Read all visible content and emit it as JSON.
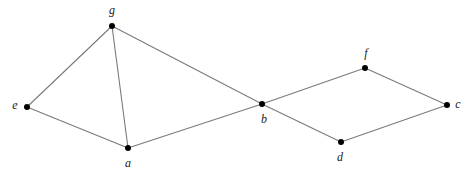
{
  "diagram": {
    "type": "undirected-graph",
    "title": "",
    "canvas": {
      "width": 470,
      "height": 178,
      "background": "#ffffff"
    },
    "style": {
      "edge_color": "#7a7a7a",
      "edge_width": 1.1,
      "node_color": "#000000",
      "node_radius": 3,
      "label_color": "#1a1a1a",
      "label_font_size": 12,
      "label_style": "italic"
    },
    "nodes": [
      {
        "id": "g",
        "label": "g",
        "x": 112,
        "y": 26,
        "label_x": 112,
        "label_y": 11
      },
      {
        "id": "e",
        "label": "e",
        "x": 27,
        "y": 107,
        "label_x": 15,
        "label_y": 106
      },
      {
        "id": "a",
        "label": "a",
        "x": 128,
        "y": 148,
        "label_x": 128,
        "label_y": 164
      },
      {
        "id": "b",
        "label": "b",
        "x": 262,
        "y": 104,
        "label_x": 264,
        "label_y": 120
      },
      {
        "id": "f",
        "label": "f",
        "x": 365,
        "y": 68,
        "label_x": 366,
        "label_y": 54
      },
      {
        "id": "d",
        "label": "d",
        "x": 341,
        "y": 142,
        "label_x": 340,
        "label_y": 158
      },
      {
        "id": "c",
        "label": "c",
        "x": 447,
        "y": 105,
        "label_x": 458,
        "label_y": 105
      }
    ],
    "edges": [
      {
        "id": "edge-g-e",
        "source": "g",
        "target": "e"
      },
      {
        "id": "edge-g-a",
        "source": "g",
        "target": "a"
      },
      {
        "id": "edge-g-b",
        "source": "g",
        "target": "b"
      },
      {
        "id": "edge-e-a",
        "source": "e",
        "target": "a"
      },
      {
        "id": "edge-a-b",
        "source": "a",
        "target": "b"
      },
      {
        "id": "edge-b-f",
        "source": "b",
        "target": "f"
      },
      {
        "id": "edge-b-d",
        "source": "b",
        "target": "d"
      },
      {
        "id": "edge-f-c",
        "source": "f",
        "target": "c"
      },
      {
        "id": "edge-d-c",
        "source": "d",
        "target": "c"
      }
    ]
  }
}
